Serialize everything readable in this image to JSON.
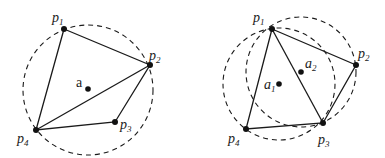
{
  "figure": {
    "left": {
      "center_label": {
        "base": "a",
        "sub": ""
      },
      "points": [
        {
          "base": "p",
          "sub": "1"
        },
        {
          "base": "p",
          "sub": "2"
        },
        {
          "base": "p",
          "sub": "3"
        },
        {
          "base": "p",
          "sub": "4"
        }
      ]
    },
    "right": {
      "centers": [
        {
          "base": "a",
          "sub": "1"
        },
        {
          "base": "a",
          "sub": "2"
        }
      ],
      "points": [
        {
          "base": "p",
          "sub": "1"
        },
        {
          "base": "p",
          "sub": "2"
        },
        {
          "base": "p",
          "sub": "3"
        },
        {
          "base": "p",
          "sub": "4"
        }
      ]
    },
    "colors": {
      "ink": "#1a1a1a",
      "background": "#ffffff"
    }
  }
}
